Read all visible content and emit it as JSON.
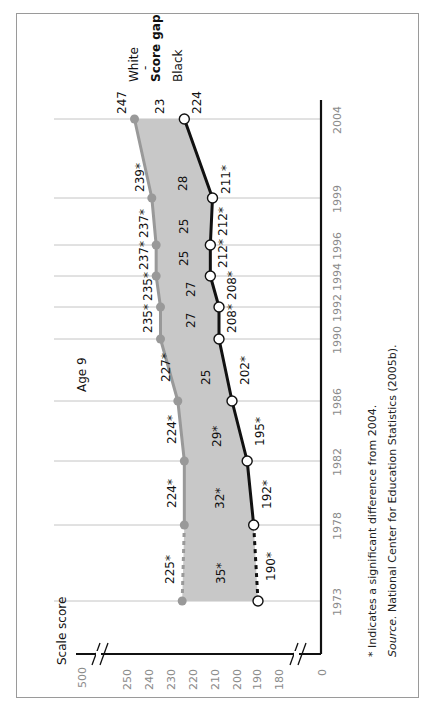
{
  "chart_data": {
    "type": "line",
    "orientation": "rotated-90-ccw",
    "title": "Age 9",
    "ylabel": "Scale score",
    "xlabel": "",
    "categories": [
      "1973",
      "1978",
      "1982",
      "1986",
      "1990",
      "1992",
      "1994",
      "1996",
      "1999",
      "2004"
    ],
    "series": [
      {
        "name": "White",
        "color": "#999999",
        "values": [
          225,
          224,
          224,
          227,
          235,
          235,
          237,
          237,
          239,
          247
        ],
        "labels": [
          "225*",
          "224*",
          "224*",
          "227*",
          "235*",
          "235*",
          "237*",
          "237*",
          "239*",
          "247"
        ]
      },
      {
        "name": "Black",
        "color": "#111111",
        "values": [
          190,
          192,
          195,
          202,
          208,
          208,
          212,
          212,
          211,
          224
        ],
        "labels": [
          "190*",
          "192*",
          "195*",
          "202*",
          "208*",
          "208*",
          "212*",
          "212*",
          "211*",
          "224"
        ]
      },
      {
        "name": "Score gap",
        "color": "#c8c8c8",
        "values": [
          35,
          32,
          29,
          25,
          27,
          27,
          25,
          25,
          28,
          23
        ],
        "labels": [
          "35*",
          "32*",
          "29*",
          "25",
          "27",
          "27",
          "25",
          "25",
          "28",
          "23"
        ]
      }
    ],
    "y_ticks": [
      "0",
      "180",
      "190",
      "200",
      "210",
      "220",
      "230",
      "240",
      "250",
      "500"
    ],
    "ylim": [
      180,
      250
    ],
    "axis_breaks": true,
    "grid": true,
    "legend": [
      "White",
      "Score gap",
      "Black"
    ],
    "legend_position": "top-right (rotated)",
    "dashed_segment": "1973-1978"
  },
  "legend": {
    "white": "White",
    "dash": "-",
    "gap": "Score gap",
    "black": "Black"
  },
  "panel_label": "Age 9",
  "axis_title": "Scale score",
  "footnote": "* Indicates a significant difference from 2004.",
  "source_prefix": "Source.",
  "source_text": " National Center for Education Statistics (2005b)."
}
